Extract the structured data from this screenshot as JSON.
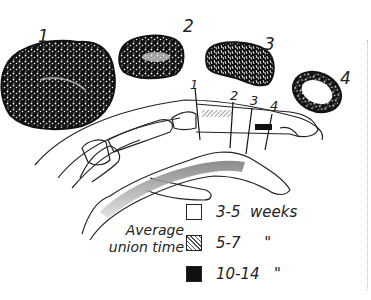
{
  "figure": {
    "cross_sections": [
      {
        "label": "1",
        "pattern": "dense-cancellous"
      },
      {
        "label": "2",
        "pattern": "cancellous-light-center"
      },
      {
        "label": "3",
        "pattern": "elongated-cancellous"
      },
      {
        "label": "4",
        "pattern": "cortical-ring-hollow"
      }
    ],
    "finger_markers": [
      "1",
      "2",
      "3",
      "4"
    ],
    "legend": {
      "title_line1": "Average",
      "title_line2": "union time",
      "items": [
        {
          "swatch": "white",
          "text": "3-5  weeks"
        },
        {
          "swatch": "hatched",
          "text": "5-7     \""
        },
        {
          "swatch": "black",
          "text": "10-14   \""
        }
      ]
    },
    "colors": {
      "ink": "#111111",
      "paper": "#ffffff",
      "hatch": "#555555"
    }
  }
}
